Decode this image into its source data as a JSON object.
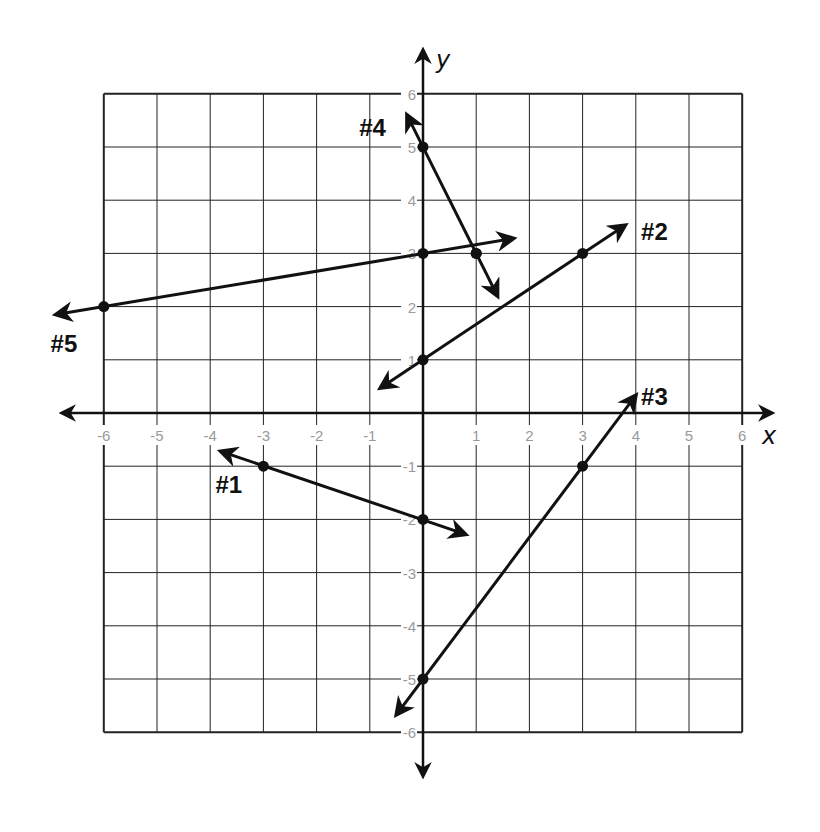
{
  "chart_data": {
    "type": "line",
    "title": "",
    "xlabel": "x",
    "ylabel": "y",
    "xlim": [
      -6,
      6
    ],
    "ylim": [
      -6,
      6
    ],
    "grid": true,
    "x_ticks": [
      "-6",
      "-5",
      "-4",
      "-3",
      "-2",
      "-1",
      "1",
      "2",
      "3",
      "4",
      "5",
      "6"
    ],
    "y_ticks": [
      "6",
      "5",
      "4",
      "3",
      "2",
      "1",
      "-1",
      "-2",
      "-3",
      "-4",
      "-5",
      "-6"
    ],
    "series": [
      {
        "name": "#1",
        "points": [
          [
            -3,
            -1
          ],
          [
            0,
            -2
          ]
        ],
        "ends": [
          [
            -3.8,
            -0.72
          ],
          [
            0.8,
            -2.28
          ]
        ],
        "label_pos": [
          -3.9,
          -1.35
        ]
      },
      {
        "name": "#2",
        "points": [
          [
            0,
            1
          ],
          [
            3,
            3
          ]
        ],
        "ends": [
          [
            -0.8,
            0.47
          ],
          [
            3.8,
            3.53
          ]
        ],
        "label_pos": [
          4.1,
          3.4
        ]
      },
      {
        "name": "#3",
        "points": [
          [
            0,
            -5
          ],
          [
            3,
            -1
          ]
        ],
        "ends": [
          [
            -0.5,
            -5.67
          ],
          [
            4.0,
            0.33
          ]
        ],
        "label_pos": [
          4.1,
          0.3
        ]
      },
      {
        "name": "#4",
        "points": [
          [
            0,
            5
          ],
          [
            1,
            3
          ]
        ],
        "ends": [
          [
            -0.3,
            5.6
          ],
          [
            1.4,
            2.2
          ]
        ],
        "label_pos": [
          -1.2,
          5.35
        ]
      },
      {
        "name": "#5",
        "points": [
          [
            -6,
            2
          ],
          [
            0,
            3
          ]
        ],
        "ends": [
          [
            -6.9,
            1.85
          ],
          [
            1.7,
            3.28
          ]
        ],
        "label_pos": [
          -7.0,
          1.3
        ]
      }
    ],
    "extra_points": [
      [
        1,
        3
      ]
    ]
  }
}
